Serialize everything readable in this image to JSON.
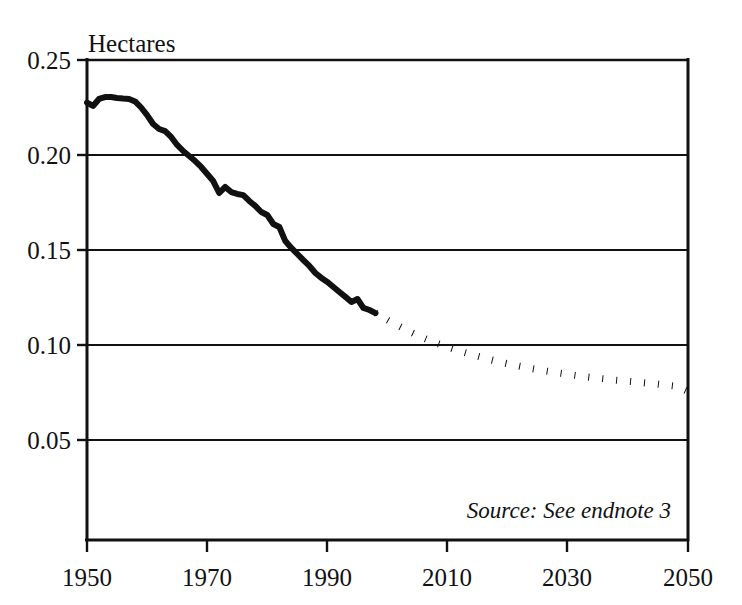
{
  "chart_data": {
    "type": "line",
    "title": "",
    "ylabel": "Hectares",
    "xlabel": "",
    "grid": true,
    "legend_position": "none",
    "xlim": [
      1950,
      2050
    ],
    "ylim": [
      0.0237,
      0.25
    ],
    "x_ticks": [
      "1950",
      "1970",
      "1990",
      "2010",
      "2030",
      "2050"
    ],
    "x_tick_values": [
      1950,
      1970,
      1990,
      2010,
      2030,
      2050
    ],
    "y_ticks": [
      "0.05",
      "0.10",
      "0.15",
      "0.20",
      "0.25"
    ],
    "y_tick_values": [
      0.05,
      0.1,
      0.15,
      0.2,
      0.25
    ],
    "annotations": [
      {
        "name": "source-note",
        "text": "Source: See endnote 3",
        "style": "italic"
      }
    ],
    "series": [
      {
        "name": "Grainland per Person (historical)",
        "style": "solid",
        "color": "#111111",
        "x": [
          1950,
          1951,
          1952,
          1953,
          1954,
          1955,
          1956,
          1957,
          1958,
          1959,
          1960,
          1961,
          1962,
          1963,
          1964,
          1965,
          1966,
          1967,
          1968,
          1969,
          1970,
          1971,
          1972,
          1973,
          1974,
          1975,
          1976,
          1977,
          1978,
          1979,
          1980,
          1981,
          1982,
          1983,
          1984,
          1985,
          1986,
          1987,
          1988,
          1989,
          1990,
          1991,
          1992,
          1993,
          1994,
          1995,
          1996,
          1997,
          1998
        ],
        "y": [
          0.2276,
          0.2258,
          0.2295,
          0.2305,
          0.2305,
          0.23,
          0.2297,
          0.2295,
          0.2282,
          0.225,
          0.221,
          0.2163,
          0.2137,
          0.2126,
          0.2095,
          0.2053,
          0.2021,
          0.1995,
          0.1968,
          0.1937,
          0.19,
          0.1863,
          0.18,
          0.1832,
          0.1805,
          0.1795,
          0.1789,
          0.1758,
          0.1732,
          0.17,
          0.1684,
          0.1637,
          0.1621,
          0.1547,
          0.1511,
          0.1479,
          0.1447,
          0.1416,
          0.1379,
          0.1353,
          0.1332,
          0.1305,
          0.1279,
          0.1253,
          0.1226,
          0.1242,
          0.1195,
          0.1184,
          0.1168
        ]
      },
      {
        "name": "Grainland per Person (projected)",
        "style": "dotted",
        "color": "#111111",
        "x": [
          1998,
          2000,
          2002,
          2004,
          2006,
          2008,
          2010,
          2012,
          2014,
          2016,
          2018,
          2020,
          2022,
          2024,
          2026,
          2028,
          2030,
          2032,
          2034,
          2036,
          2038,
          2040,
          2042,
          2044,
          2046,
          2048,
          2050
        ],
        "y": [
          0.1168,
          0.1132,
          0.1098,
          0.1066,
          0.1037,
          0.1011,
          0.0989,
          0.0968,
          0.0949,
          0.0932,
          0.0916,
          0.0901,
          0.0888,
          0.0876,
          0.0865,
          0.0855,
          0.0846,
          0.0837,
          0.0829,
          0.0822,
          0.0815,
          0.0809,
          0.0803,
          0.0797,
          0.079,
          0.0783,
          0.0755
        ]
      }
    ]
  },
  "plot": {
    "unit_label": "Hectares",
    "source_note": "Source: See endnote 3"
  }
}
